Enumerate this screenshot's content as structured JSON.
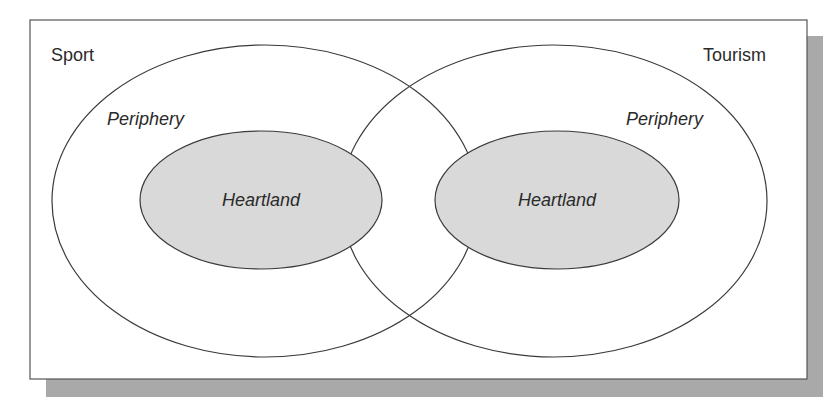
{
  "diagram": {
    "type": "overlapping-venn",
    "colors": {
      "frame_stroke": "#555555",
      "shadow": "#a9a9a9",
      "ellipse_stroke": "#3a3a3a",
      "heartland_fill": "#d9d9d9",
      "text": "#2a2a2a"
    },
    "sets": [
      {
        "name": "Sport",
        "periphery_label": "Periphery",
        "heartland_label": "Heartland"
      },
      {
        "name": "Tourism",
        "periphery_label": "Periphery",
        "heartland_label": "Heartland"
      }
    ]
  }
}
